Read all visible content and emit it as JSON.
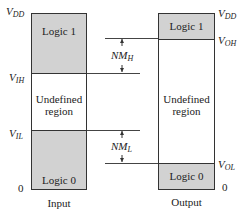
{
  "figure": {
    "input": {
      "caption": "Input",
      "zones": {
        "top": "Logic 1",
        "middle_line1": "Undefined",
        "middle_line2": "region",
        "bottom": "Logic 0"
      },
      "levels": {
        "vdd": {
          "main": "V",
          "sub": "DD"
        },
        "vih": {
          "main": "V",
          "sub": "IH"
        },
        "vil": {
          "main": "V",
          "sub": "IL"
        },
        "zero": "0"
      }
    },
    "output": {
      "caption": "Output",
      "zones": {
        "top": "Logic 1",
        "middle_line1": "Undefined",
        "middle_line2": "region",
        "bottom": "Logic 0"
      },
      "levels": {
        "vdd": {
          "main": "V",
          "sub": "DD"
        },
        "voh": {
          "main": "V",
          "sub": "OH"
        },
        "vol": {
          "main": "V",
          "sub": "OL"
        },
        "zero": "0"
      }
    },
    "noise_margins": {
      "high": {
        "main": "NM",
        "sub": "H"
      },
      "low": {
        "main": "NM",
        "sub": "L"
      }
    },
    "colors": {
      "logic_zone_fill": "#d2d2d2",
      "undefined_zone_fill": "#ffffff",
      "border": "#333333"
    }
  }
}
